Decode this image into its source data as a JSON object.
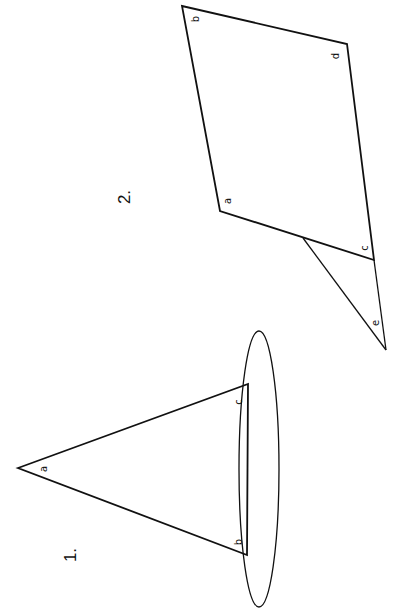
{
  "figures": [
    {
      "number_label": "1.",
      "description": "Triangle resting on an ellipse",
      "vertices": [
        {
          "name": "a",
          "label": "a"
        },
        {
          "name": "b",
          "label": "b"
        },
        {
          "name": "c",
          "label": "c"
        }
      ]
    },
    {
      "number_label": "2.",
      "description": "Quadrilateral with attached triangle",
      "vertices": [
        {
          "name": "a",
          "label": "a"
        },
        {
          "name": "b",
          "label": "b"
        },
        {
          "name": "c",
          "label": "c"
        },
        {
          "name": "d",
          "label": "d"
        },
        {
          "name": "e",
          "label": "e"
        }
      ]
    }
  ],
  "colors": {
    "stroke": "#111111",
    "background": "#ffffff"
  }
}
